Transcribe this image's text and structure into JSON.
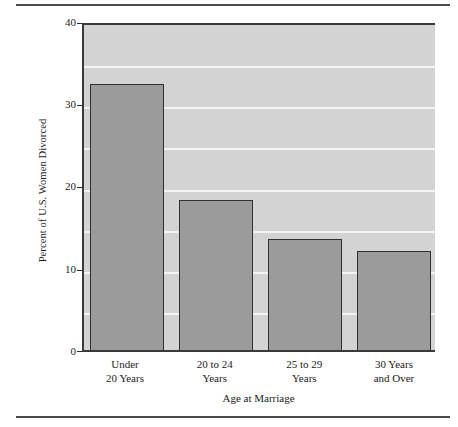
{
  "chart_data": {
    "type": "bar",
    "title": "",
    "xlabel": "Age at Marriage",
    "ylabel": "Percent of U.S. Women Divorced",
    "categories": [
      "Under 20 Years",
      "20 to 24 Years",
      "25 to 29 Years",
      "30 Years and Over"
    ],
    "category_lines": [
      {
        "line1": "Under",
        "line2": "20 Years"
      },
      {
        "line1": "20 to 24",
        "line2": "Years"
      },
      {
        "line1": "25 to 29",
        "line2": "Years"
      },
      {
        "line1": "30 Years",
        "line2": "and Over"
      }
    ],
    "values": [
      32.3,
      18.2,
      13.5,
      12.0
    ],
    "ylim": [
      0,
      40
    ],
    "yticks": [
      "0",
      "10",
      "20",
      "30",
      "40"
    ],
    "ytick_values": [
      0,
      10,
      20,
      30,
      40
    ],
    "gridlines": [
      5,
      10,
      15,
      20,
      25,
      30,
      35
    ],
    "grid": true,
    "legend": "none",
    "colors": {
      "bar_fill": "#9b9b9b",
      "bar_border": "#303030",
      "plot_background": "#d3d3d3",
      "gridline": "#f4f4f4",
      "axis": "#3a3a3a",
      "rule": "#4a4a4a",
      "text": "#1b1b1b"
    }
  }
}
